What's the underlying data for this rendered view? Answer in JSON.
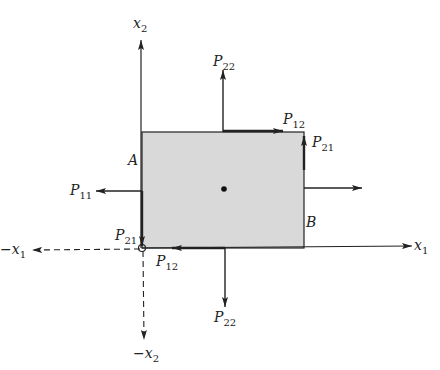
{
  "diagram": {
    "colors": {
      "fill": "#d9d9d9",
      "line": "#222222",
      "background": "#ffffff"
    },
    "axes": {
      "x1_pos": {
        "base": "x",
        "sub": "1",
        "sign": ""
      },
      "x1_neg": {
        "base": "x",
        "sub": "1",
        "sign": "−"
      },
      "x2_pos": {
        "base": "x",
        "sub": "2",
        "sign": ""
      },
      "x2_neg": {
        "base": "x",
        "sub": "2",
        "sign": "−"
      }
    },
    "corner_labels": {
      "A": "A",
      "B": "B"
    },
    "forces": {
      "top_normal": {
        "base": "P",
        "sub": "22"
      },
      "bottom_normal": {
        "base": "P",
        "sub": "22"
      },
      "left_normal": {
        "base": "P",
        "sub": "11"
      },
      "top_shear": {
        "base": "P",
        "sub": "12"
      },
      "right_shear": {
        "base": "P",
        "sub": "21"
      },
      "left_shear": {
        "base": "P",
        "sub": "21"
      },
      "bottom_shear": {
        "base": "P",
        "sub": "12"
      }
    }
  }
}
